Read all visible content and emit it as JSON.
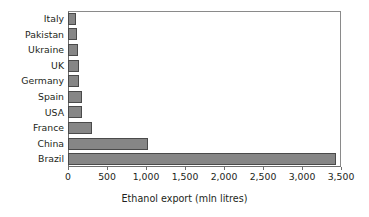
{
  "chart_data": {
    "type": "bar",
    "orientation": "horizontal",
    "title": "",
    "xlabel": "Ethanol export (mln litres)",
    "ylabel": "",
    "categories": [
      "Italy",
      "Pakistan",
      "Ukraine",
      "UK",
      "Germany",
      "Spain",
      "USA",
      "France",
      "China",
      "Brazil"
    ],
    "values": [
      105,
      110,
      125,
      140,
      145,
      180,
      185,
      310,
      1020,
      3430
    ],
    "xlim": [
      0,
      3500
    ],
    "xticks": [
      0,
      500,
      1000,
      1500,
      2000,
      2500,
      3000,
      3500
    ],
    "xtick_labels": [
      "0",
      "500",
      "1,000",
      "1,500",
      "2,000",
      "2,500",
      "3,000",
      "3,500"
    ],
    "grid": false,
    "legend": false,
    "bar_color": "#868686",
    "bar_edge_color": "#4a4a4a",
    "axis_color": "#6e6e6e",
    "text_color": "#231f20",
    "background": "#ffffff"
  }
}
